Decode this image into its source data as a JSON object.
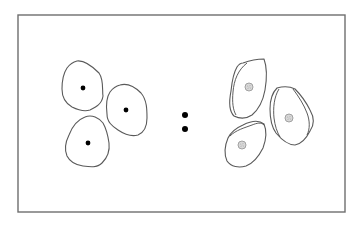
{
  "diagram": {
    "type": "cell-comparison",
    "frame": {
      "x": 18,
      "y": 15,
      "width": 327,
      "height": 197,
      "stroke": "#6e6e6e"
    },
    "separator": {
      "symbol": ":",
      "dots": [
        {
          "cx": 185,
          "cy": 115,
          "r": 3
        },
        {
          "cx": 185,
          "cy": 129,
          "r": 3
        }
      ]
    },
    "left_group": {
      "description": "Three cells with single outlines and small dense black nuclei",
      "nucleus_color": "#000000",
      "cells": [
        {
          "outline": "M77,61 C85,60 93,67 99,73 C104,80 102,90 103,96 C102,104 96,107 90,110 C84,112 78,110 72,107 C65,103 62,96 62,89 C62,81 63,74 67,68 C70,64 73,62 77,61 Z",
          "nucleus": {
            "cx": 83,
            "cy": 88,
            "r": 2.4
          }
        },
        {
          "outline": "M120,85 C127,83 135,87 141,93 C147,100 147,110 147,118 C147,126 145,132 138,135 C131,137 124,134 118,130 C112,126 107,122 107,114 C106,106 106,98 110,92 C113,88 116,86 120,85 Z",
          "nucleus": {
            "cx": 126,
            "cy": 110,
            "r": 2.4
          }
        },
        {
          "outline": "M85,117 C92,114 99,118 103,123 C107,130 108,136 109,143 C110,151 107,158 102,163 C97,168 90,167 83,166 C76,165 70,162 67,156 C64,149 66,141 69,135 C72,127 77,120 85,117 Z",
          "nucleus": {
            "cx": 88,
            "cy": 143,
            "r": 2.4
          }
        }
      ]
    },
    "right_group": {
      "description": "Three cells with double outlines and enlarged pale speckled nuclei",
      "nucleus_color": "#d8d8d8",
      "cells": [
        {
          "outline": "M243,63 C251,60 259,59 264,59 C267,67 267,78 265,90 C263,101 258,110 252,115 C246,119 240,119 234,116 C229,111 229,101 231,91 C232,81 234,72 237,67 C239,64 241,63 243,63 Z",
          "inner": "M247,63 C238,70 234,80 233,92 C232,102 233,110 236,115",
          "nucleus": {
            "cx": 249,
            "cy": 87,
            "r": 4
          }
        },
        {
          "outline": "M277,88 C284,86 291,87 295,89 C301,95 306,102 310,110 C314,117 315,124 310,131 C306,139 301,144 295,145 C288,145 281,139 276,133 C271,126 270,118 270,109 C270,100 272,93 277,88 Z",
          "inner": "M293,89 C299,97 304,105 307,113 C310,121 310,129 307,135",
          "inner2": "M279,89 C274,97 273,108 274,118 C275,126 277,132 280,137",
          "nucleus": {
            "cx": 289,
            "cy": 118,
            "r": 4
          }
        },
        {
          "outline": "M243,125 C251,121 259,120 264,124 C267,131 266,140 263,148 C259,156 254,163 246,166 C239,168 231,167 227,161 C224,154 225,145 228,138 C231,132 236,128 243,125 Z",
          "inner": "M230,136 C236,130 244,128 252,125 C257,123 261,122 264,125",
          "nucleus": {
            "cx": 242,
            "cy": 145,
            "r": 4
          }
        }
      ]
    }
  }
}
